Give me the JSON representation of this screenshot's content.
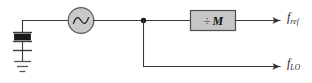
{
  "diagram": {
    "type": "circuit-block-diagram",
    "colors": {
      "wire": "#3a3a3a",
      "block_fill": "#c6c6c6",
      "block_stroke": "#4e4e4e",
      "oscillator_fill": "#c9c9c9",
      "oscillator_stroke": "#5a5a5a",
      "crystal_body": "#1a1a1a",
      "text": "#1b1b1b",
      "background": "#ffffff"
    },
    "components": {
      "crystal": {
        "name": "crystal-resonator",
        "label": ""
      },
      "ground": {
        "name": "ground-symbol",
        "label": ""
      },
      "oscillator": {
        "name": "oscillator-source",
        "symbol": "sine-wave",
        "label": ""
      },
      "divider": {
        "name": "frequency-divider",
        "operator": "÷",
        "variable": "M",
        "full_label": "÷ M"
      },
      "junction": {
        "name": "signal-junction-node"
      }
    },
    "outputs": [
      {
        "id": "fref",
        "base": "f",
        "subscript": "ref",
        "full": "f ref",
        "description": "reference frequency output"
      },
      {
        "id": "flo",
        "base": "f",
        "subscript": "LO",
        "full": "f LO",
        "description": "local oscillator frequency output"
      }
    ]
  }
}
